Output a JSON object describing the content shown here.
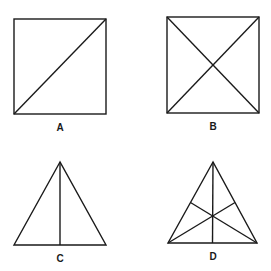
{
  "figure": {
    "panels": [
      {
        "id": "A",
        "label": "A",
        "shape": "square",
        "construction": "one diagonal (bottom-left to top-right)"
      },
      {
        "id": "B",
        "label": "B",
        "shape": "square",
        "construction": "two diagonals"
      },
      {
        "id": "C",
        "label": "C",
        "shape": "triangle",
        "construction": "one altitude from apex to base"
      },
      {
        "id": "D",
        "label": "D",
        "shape": "triangle",
        "construction": "three medians meeting at centroid"
      }
    ]
  },
  "colors": {
    "stroke": "#1a1a1a",
    "background": "#ffffff"
  }
}
